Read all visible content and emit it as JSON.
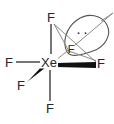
{
  "diagram": {
    "type": "lewis-structure",
    "canvas": {
      "width": 114,
      "height": 124
    },
    "colors": {
      "bond": "#3c3c3c",
      "thin_bond": "#8a8a8a",
      "wedge": "#111111",
      "label": "#262626",
      "lobe_outline": "#555555",
      "background": "#ffffff"
    },
    "central_atom": {
      "name": "central-atom-xe",
      "label": "Xe",
      "x": 49,
      "y": 62
    },
    "substituents": [
      {
        "name": "fluorine-top",
        "label": "F",
        "x": 51,
        "y": 17,
        "bond": "plain"
      },
      {
        "name": "fluorine-left",
        "label": "F",
        "x": 9,
        "y": 62,
        "bond": "plain"
      },
      {
        "name": "fluorine-bottom",
        "label": "F",
        "x": 50,
        "y": 108,
        "bond": "plain"
      },
      {
        "name": "fluorine-lower-left",
        "label": "F",
        "x": 21,
        "y": 85,
        "bond": "wedge"
      },
      {
        "name": "fluorine-right",
        "label": "F",
        "x": 101,
        "y": 63,
        "bond": "wedge"
      },
      {
        "name": "fluorine-back",
        "label": "F",
        "x": 71,
        "y": 49,
        "bond": "thin"
      }
    ],
    "lone_pair": {
      "name": "lone-pair-lobe",
      "dots": "··",
      "dot_count": 2,
      "lobe_center_x": 83,
      "lobe_center_y": 31
    }
  }
}
